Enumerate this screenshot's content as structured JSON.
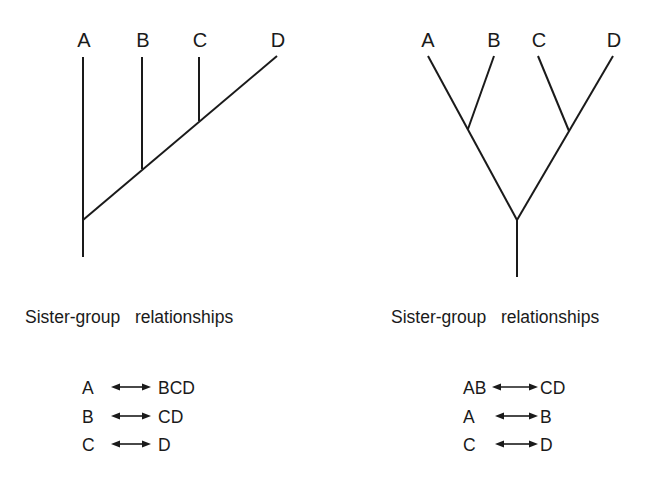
{
  "colors": {
    "ink": "#1a1a1a",
    "background": "#ffffff"
  },
  "trees": [
    {
      "id": "pectinate",
      "taxa": [
        {
          "label": "A",
          "x": 84,
          "y": 47
        },
        {
          "label": "B",
          "x": 143,
          "y": 47
        },
        {
          "label": "C",
          "x": 200,
          "y": 47
        },
        {
          "label": "D",
          "x": 278,
          "y": 47
        }
      ],
      "branches": [
        {
          "x1": 83,
          "y1": 57,
          "x2": 83,
          "y2": 257
        },
        {
          "x1": 83,
          "y1": 220,
          "x2": 277,
          "y2": 56
        },
        {
          "x1": 142,
          "y1": 57,
          "x2": 142,
          "y2": 169
        },
        {
          "x1": 199,
          "y1": 57,
          "x2": 199,
          "y2": 121
        }
      ],
      "caption": {
        "text": "Sister-group   relationships",
        "x": 25,
        "y": 323
      },
      "relationships": [
        {
          "left": "A",
          "right": "BCD",
          "lx": 82,
          "ax1": 111,
          "ax2": 151,
          "rx": 158,
          "y": 394
        },
        {
          "left": "B",
          "right": "CD",
          "lx": 82,
          "ax1": 111,
          "ax2": 151,
          "rx": 158,
          "y": 423
        },
        {
          "left": "C",
          "right": "D",
          "lx": 82,
          "ax1": 111,
          "ax2": 151,
          "rx": 158,
          "y": 451
        }
      ]
    },
    {
      "id": "balanced",
      "taxa": [
        {
          "label": "A",
          "x": 428,
          "y": 47
        },
        {
          "label": "B",
          "x": 494,
          "y": 47
        },
        {
          "label": "C",
          "x": 539,
          "y": 47
        },
        {
          "label": "D",
          "x": 614,
          "y": 47
        }
      ],
      "branches": [
        {
          "x1": 428,
          "y1": 56,
          "x2": 517,
          "y2": 220
        },
        {
          "x1": 494,
          "y1": 56,
          "x2": 468,
          "y2": 129
        },
        {
          "x1": 613,
          "y1": 56,
          "x2": 517,
          "y2": 220
        },
        {
          "x1": 538,
          "y1": 56,
          "x2": 569,
          "y2": 131
        },
        {
          "x1": 517,
          "y1": 219,
          "x2": 517,
          "y2": 277
        }
      ],
      "caption": {
        "text": "Sister-group   relationships",
        "x": 391,
        "y": 323
      },
      "relationships": [
        {
          "left": "AB",
          "right": "CD",
          "lx": 463,
          "ax1": 492,
          "ax2": 538,
          "rx": 540,
          "y": 394
        },
        {
          "left": "A",
          "right": "B",
          "lx": 463,
          "ax1": 495,
          "ax2": 538,
          "rx": 540,
          "y": 423
        },
        {
          "left": "C",
          "right": "D",
          "lx": 463,
          "ax1": 495,
          "ax2": 538,
          "rx": 540,
          "y": 451
        }
      ]
    }
  ]
}
